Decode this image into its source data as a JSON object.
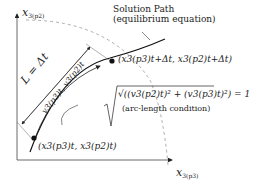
{
  "axes": {
    "y_label": "x",
    "y_label_sub": "3(p",
    "y_label_sub2": "2",
    "x_label": "x",
    "x_label_sub": "3(p",
    "x_label_sub2": "3"
  },
  "solution_path": {
    "line1": "Solution Path",
    "line2": "(equilibrium equation)"
  },
  "length_label": "L = Δt",
  "tangent_label": "(v",
  "tangent_text": "v3(p3)t, v3(p2)t",
  "start_point": {
    "text": "(x3(p3)t, x3(p2)t)"
  },
  "end_point": {
    "text": "(x3(p3)t+Δt, x3(p2)t+Δt)"
  },
  "arc_condition": {
    "equation": "√((v3(p2)t)² + (v3(p3)t)²) = 1",
    "caption": "(arc-length condition)"
  },
  "colors": {
    "ink": "#222222",
    "dashed": "#999999"
  }
}
